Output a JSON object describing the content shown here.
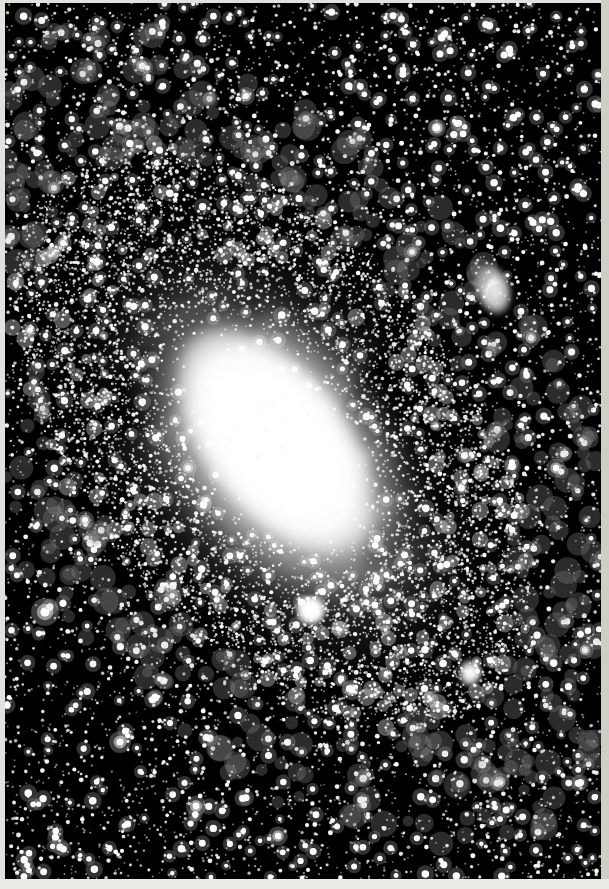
{
  "image": {
    "title": "The Great Nebula in Andromeda",
    "catalog_designation": "M31",
    "alt_designation": "NGC 224",
    "constellation": "Andromeda",
    "medium": "black-and-white photographic plate",
    "orientation": "portrait",
    "width_px": 609,
    "height_px": 889,
    "border_color": "#e3e1dc",
    "sky_color": "#000000",
    "star_color": "#ffffff"
  },
  "scene": {
    "description": "Long-exposure monochrome astrophotograph of a large inclined spiral galaxy set in a dense field of stars.",
    "subject": "spiral galaxy seen at a steep inclination",
    "major_axis_angle_deg": -38,
    "galaxy": {
      "name": "M31",
      "center_x": 272,
      "center_y": 438,
      "core_brightness": "saturated white",
      "halo_extent_px": [
        460,
        640
      ],
      "dust_lanes_visible": true,
      "dust_lane_count": 3
    },
    "companions": [
      {
        "name": "M110",
        "alt_name": "NGC 205",
        "x": 490,
        "y": 289,
        "shape": "elongated elliptical",
        "position": "upper right"
      },
      {
        "name": "M32",
        "alt_name": "NGC 221",
        "x": 306,
        "y": 607,
        "shape": "compact round elliptical",
        "position": "below the nucleus"
      },
      {
        "name": "star cloud knot",
        "alt_name": "NGC 206 region",
        "x": 465,
        "y": 670,
        "shape": "bright irregular knot",
        "position": "southern spiral arm"
      }
    ],
    "starfield": {
      "density": "very dense",
      "brightest_star_x": 45,
      "brightest_star_y": 612,
      "note": "foreground stars scattered uniformly across the full frame"
    }
  },
  "colors": {
    "sky": "#000000",
    "star": "#ffffff",
    "halo": "#9a9a98",
    "disc": "#cdcdca",
    "core": "#ffffff",
    "paper_border": "#e3e1dc"
  }
}
